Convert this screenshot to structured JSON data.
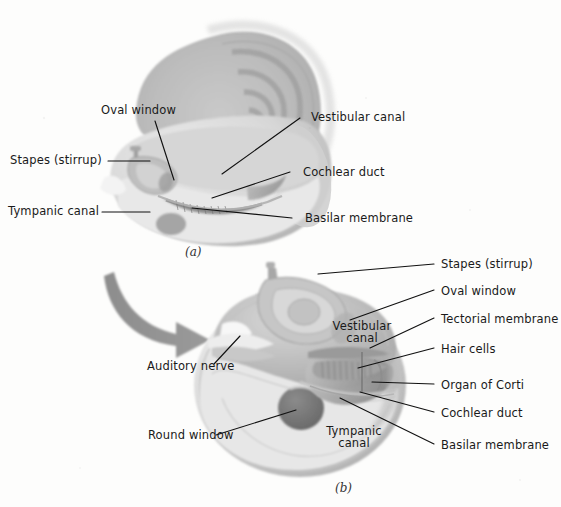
{
  "figure": {
    "background_color": "#fdfdfc",
    "line_color": "#111111",
    "text_color": "#1a1a1a"
  },
  "panel_a": {
    "caption": "(a)",
    "labels": {
      "oval_window": "Oval window",
      "stapes": "Stapes (stirrup)",
      "tympanic_canal": "Tympanic canal",
      "vestibular_canal": "Vestibular canal",
      "cochlear_duct": "Cochlear duct",
      "basilar_membrane": "Basilar membrane"
    }
  },
  "panel_b": {
    "caption": "(b)",
    "labels": {
      "stapes": "Stapes (stirrup)",
      "oval_window": "Oval window",
      "tectorial_membrane": "Tectorial membrane",
      "hair_cells": "Hair cells",
      "organ_of_corti": "Organ of Corti",
      "cochlear_duct": "Cochlear duct",
      "basilar_membrane": "Basilar membrane",
      "auditory_nerve": "Auditory nerve",
      "round_window": "Round window",
      "vestibular_canal_line1": "Vestibular",
      "vestibular_canal_line2": "canal",
      "tympanic_canal_line1": "Tympanic",
      "tympanic_canal_line2": "canal"
    }
  },
  "palette": {
    "arrow": "#8a8a8a",
    "tissue_light": "#dcdcdc",
    "tissue_mid": "#b9b9b9",
    "tissue_dark": "#8f8f8f",
    "window_dark": "#6f6f6f"
  }
}
